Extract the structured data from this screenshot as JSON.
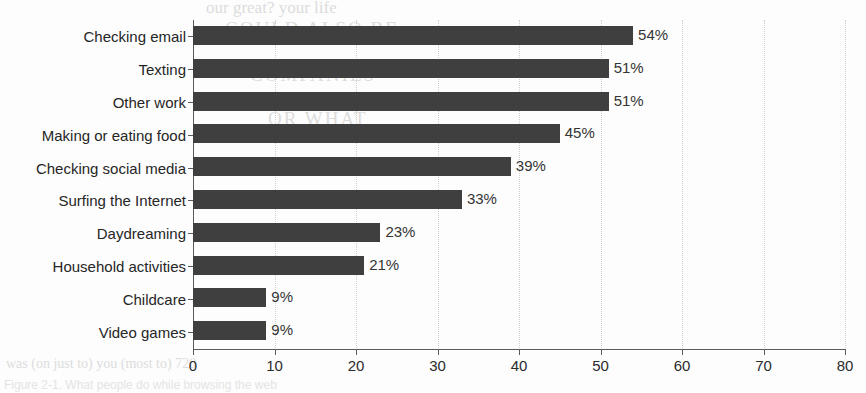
{
  "chart_data": {
    "type": "bar",
    "orientation": "horizontal",
    "title": "",
    "xlabel": "",
    "ylabel": "",
    "xlim": [
      0,
      80
    ],
    "xticks": [
      0,
      10,
      20,
      30,
      40,
      50,
      60,
      70,
      80
    ],
    "xtick_labels": [
      "0",
      "10",
      "20",
      "30",
      "40",
      "50",
      "60",
      "70",
      "80"
    ],
    "grid": "vertical-dotted",
    "legend": "none",
    "bar_color": "#3f3f3f",
    "value_suffix": "%",
    "categories": [
      "Checking email",
      "Texting",
      "Other work",
      "Making or eating food",
      "Checking social media",
      "Surfing the Internet",
      "Daydreaming",
      "Household activities",
      "Childcare",
      "Video games"
    ],
    "values": [
      54,
      51,
      51,
      45,
      39,
      33,
      23,
      21,
      9,
      9
    ],
    "data_labels": [
      "54%",
      "51%",
      "51%",
      "45%",
      "39%",
      "33%",
      "23%",
      "21%",
      "9%",
      "9%"
    ]
  },
  "bleed_text": {
    "line_top": "our great? your life",
    "line_a": "COULD ALSO BE",
    "line_b": "COMPANIES",
    "line_c": "OR WHAT",
    "line_axis": "was (on just to) you (most to) 720",
    "caption": "Figure 2-1. What people do while browsing the web"
  }
}
